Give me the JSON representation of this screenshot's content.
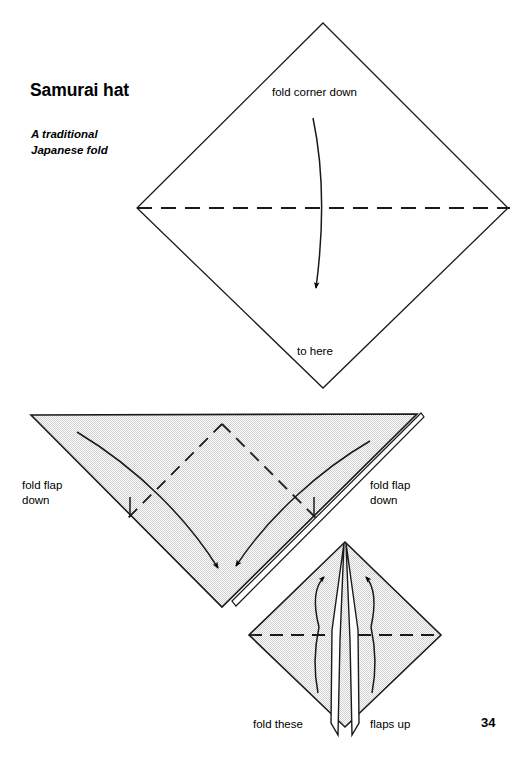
{
  "page": {
    "title": "Samurai hat",
    "subtitle": "A traditional\nJapanese fold",
    "page_number": "34",
    "background_color": "#ffffff",
    "ink_color": "#000000",
    "paper_shade_color": "#e9e9e9"
  },
  "steps": [
    {
      "id": "step-1",
      "shape": "diamond",
      "shaded": false,
      "labels": {
        "fold_corner_down": "fold corner down",
        "to_here": "to here"
      },
      "annotations": {
        "valley_fold_line": "horizontal dashed fold line",
        "arrow": "curved arrow pointing down"
      }
    },
    {
      "id": "step-2",
      "shape": "triangle",
      "shaded": true,
      "labels": {
        "fold_flap_down_left": "fold flap\ndown",
        "fold_flap_down_right": "fold flap\ndown"
      },
      "annotations": {
        "dashed_v_fold": "two dashed diagonal fold lines forming a V",
        "arrows": "two curved arrows pointing down toward the bottom point"
      }
    },
    {
      "id": "step-3",
      "shape": "diamond",
      "shaded": true,
      "labels": {
        "fold_these": "fold these",
        "flaps_up": "flaps up"
      },
      "annotations": {
        "valley_fold_line": "horizontal dashed fold line",
        "arrows": "two curved arrows pointing up"
      }
    }
  ],
  "labels_flat": {
    "fold_corner_down": "fold corner down",
    "to_here": "to here",
    "fold_flap_down_left_line1": "fold flap",
    "fold_flap_down_left_line2": "down",
    "fold_flap_down_right_line1": "fold flap",
    "fold_flap_down_right_line2": "down",
    "fold_these": "fold these",
    "flaps_up": "flaps up"
  }
}
